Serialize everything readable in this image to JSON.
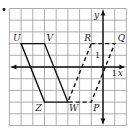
{
  "figure": {
    "bullet": "•",
    "grid": {
      "x_min": -8,
      "x_max": 2,
      "y_min": -5,
      "y_max": 5,
      "origin_px": [
        103,
        67
      ],
      "cell_px": 11.7,
      "grid_color": "#9a9a9a",
      "axis_color": "#111111"
    },
    "axes": {
      "x_label": "x",
      "y_label": "y",
      "x_tick_label": "1",
      "y_tick_label": "1"
    },
    "points": {
      "U": {
        "label": "U",
        "x": -7,
        "y": 2
      },
      "V": {
        "label": "V",
        "x": -5,
        "y": 2
      },
      "W": {
        "label": "W",
        "x": -3,
        "y": -3
      },
      "Z": {
        "label": "Z",
        "x": -5,
        "y": -3
      },
      "R": {
        "label": "R",
        "x": -1,
        "y": 2
      },
      "Q": {
        "label": "Q",
        "x": 1,
        "y": 2
      },
      "P": {
        "label": "P",
        "x": -1,
        "y": -3
      }
    },
    "shapes": [
      {
        "name": "UVWZ",
        "style": "solid",
        "vertices": [
          "U",
          "V",
          "W",
          "Z"
        ]
      },
      {
        "name": "RQPW",
        "style": "dashed",
        "vertices": [
          "R",
          "Q",
          "P",
          "W"
        ]
      }
    ]
  }
}
